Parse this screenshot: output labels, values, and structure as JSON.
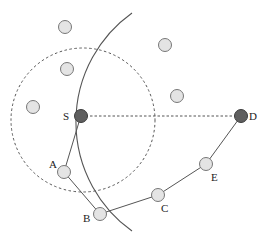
{
  "diagram": {
    "type": "routing-network",
    "labels": {
      "source": "S",
      "destination": "D",
      "a": "A",
      "b": "B",
      "c": "C",
      "e": "E"
    },
    "route": [
      "S",
      "A",
      "B",
      "C",
      "E",
      "D"
    ],
    "colors": {
      "endpoint_fill": "#5f5f5f",
      "relay_fill": "#e4e4e4",
      "stroke": "#555555"
    }
  }
}
